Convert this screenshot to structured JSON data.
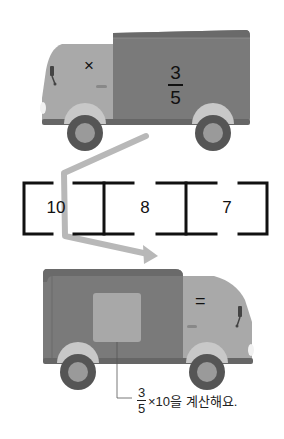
{
  "top_truck": {
    "cab_symbol": "×",
    "box_fraction": {
      "numerator": "3",
      "denominator": "5"
    }
  },
  "sequence": {
    "cells": [
      "10",
      "8",
      "7"
    ]
  },
  "bottom_truck": {
    "cab_symbol": "="
  },
  "hint": {
    "fraction": {
      "numerator": "3",
      "denominator": "5"
    },
    "text": "×10을 계산해요."
  },
  "colors": {
    "cab": "#a9a9a9",
    "box": "#7a7a7a",
    "box_top": "#6a6a6a",
    "wheel_outer": "#555555",
    "wheel_inner": "#9a9a9a",
    "arrow": "#b8b8b8",
    "window_square": "#a8a8a8"
  }
}
